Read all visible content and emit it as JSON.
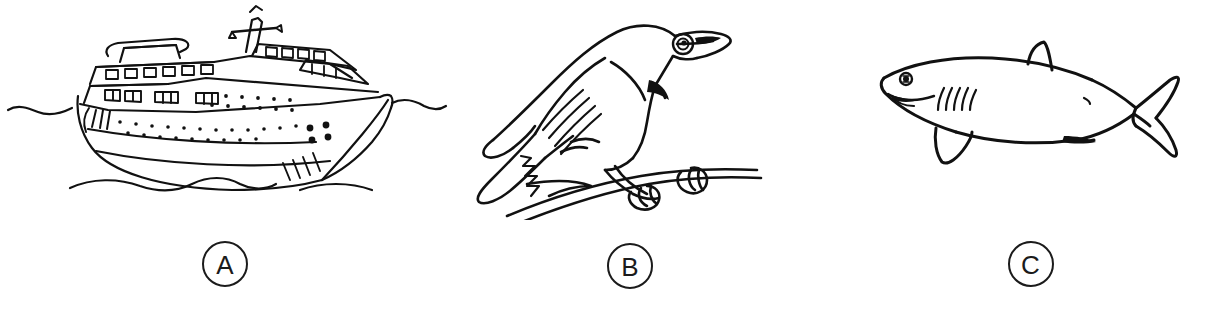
{
  "figure": {
    "type": "multi-panel-line-drawing",
    "background_color": "#ffffff",
    "ink_color": "#111111",
    "panel_count": 3,
    "panels": [
      {
        "id": "A",
        "label": "A",
        "subject": "cruise-ship",
        "subject_description": "black-and-white line drawing of a large passenger cruise ship on water",
        "icon_name": "cruise-ship-illustration"
      },
      {
        "id": "B",
        "label": "B",
        "subject": "bird",
        "subject_description": "black-and-white line drawing of a perching songbird gripping a branch",
        "icon_name": "bird-illustration"
      },
      {
        "id": "C",
        "label": "C",
        "subject": "shark",
        "subject_description": "black-and-white line drawing of a shark with dorsal fin, gills and forked tail",
        "icon_name": "shark-illustration"
      }
    ]
  }
}
